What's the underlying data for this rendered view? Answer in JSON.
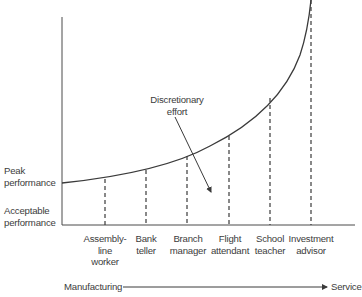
{
  "diagram": {
    "y_axis_labels": {
      "peak": [
        "Peak",
        "performance"
      ],
      "acceptable": [
        "Acceptable",
        "performance"
      ]
    },
    "annotation": {
      "text": [
        "Discretionary",
        "effort"
      ]
    },
    "occupations": [
      {
        "lines": [
          "Assembly-",
          "line",
          "worker"
        ]
      },
      {
        "lines": [
          "Bank",
          "teller"
        ]
      },
      {
        "lines": [
          "Branch",
          "manager"
        ]
      },
      {
        "lines": [
          "Flight",
          "attendant"
        ]
      },
      {
        "lines": [
          "School",
          "teacher"
        ]
      },
      {
        "lines": [
          "Investment",
          "advisor"
        ]
      }
    ],
    "continuum": {
      "start_label": "Manufacturing",
      "end_label": "Service"
    },
    "colors": {
      "line": "#3a3a3a",
      "text": "#3c3c3c"
    }
  }
}
